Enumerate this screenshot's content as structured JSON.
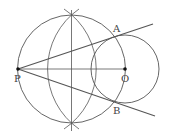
{
  "diagram": {
    "type": "geometry-construction",
    "labels": {
      "P": "P",
      "O": "O",
      "A": "A",
      "B": "B"
    },
    "points": {
      "P": [
        18,
        69
      ],
      "O": [
        125,
        69
      ],
      "A": [
        114,
        37
      ],
      "B": [
        114,
        101
      ]
    },
    "circles": {
      "large_circle": {
        "center": [
          71.5,
          69
        ],
        "r": 54
      },
      "small_circle": {
        "center": [
          125,
          69
        ],
        "r": 34
      },
      "arc_from_P": {
        "center": [
          18,
          69
        ],
        "r": 72
      },
      "arc_from_O": {
        "center": [
          125,
          69
        ],
        "r": 73
      }
    },
    "lines": {
      "PO_segment": [
        [
          18,
          69
        ],
        [
          125,
          69
        ]
      ],
      "perpendicular_bisector": [
        [
          71.5,
          10
        ],
        [
          71.5,
          131
        ]
      ],
      "tangent_PA": [
        [
          18,
          69
        ],
        [
          153,
          24
        ]
      ],
      "tangent_PB": [
        [
          18,
          69
        ],
        [
          155,
          116
        ]
      ]
    },
    "colors": {
      "stroke": "#555555",
      "label": "#444444",
      "point": "#111111"
    }
  }
}
